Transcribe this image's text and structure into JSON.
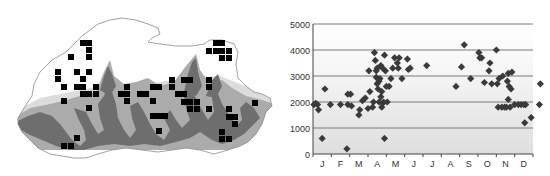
{
  "map": {
    "title": "",
    "marker_color": "#000000",
    "terrain_dark": "#6e6e6e",
    "terrain_mid": "#a8a8a8",
    "terrain_light": "#d9d9d9",
    "outline_color": "#8a8a8a",
    "markers": [
      [
        83,
        43
      ],
      [
        89,
        43
      ],
      [
        89,
        50
      ],
      [
        71,
        57
      ],
      [
        89,
        57
      ],
      [
        58,
        72
      ],
      [
        77,
        72
      ],
      [
        89,
        72
      ],
      [
        58,
        79
      ],
      [
        83,
        79
      ],
      [
        64,
        87
      ],
      [
        77,
        87
      ],
      [
        83,
        87
      ],
      [
        96,
        87
      ],
      [
        83,
        94
      ],
      [
        89,
        94
      ],
      [
        96,
        94
      ],
      [
        64,
        101
      ],
      [
        89,
        108
      ],
      [
        77,
        138
      ],
      [
        64,
        146
      ],
      [
        71,
        146
      ],
      [
        127,
        87
      ],
      [
        121,
        94
      ],
      [
        127,
        94
      ],
      [
        127,
        101
      ],
      [
        140,
        94
      ],
      [
        146,
        94
      ],
      [
        153,
        87
      ],
      [
        159,
        87
      ],
      [
        153,
        101
      ],
      [
        153,
        116
      ],
      [
        159,
        116
      ],
      [
        165,
        116
      ],
      [
        159,
        131
      ],
      [
        172,
        80
      ],
      [
        184,
        80
      ],
      [
        190,
        80
      ],
      [
        172,
        87
      ],
      [
        178,
        94
      ],
      [
        184,
        94
      ],
      [
        184,
        102
      ],
      [
        190,
        102
      ],
      [
        197,
        102
      ],
      [
        190,
        109
      ],
      [
        197,
        109
      ],
      [
        209,
        80
      ],
      [
        209,
        87
      ],
      [
        209,
        109
      ],
      [
        216,
        43
      ],
      [
        222,
        43
      ],
      [
        209,
        51
      ],
      [
        216,
        51
      ],
      [
        222,
        51
      ],
      [
        229,
        51
      ],
      [
        222,
        58
      ],
      [
        229,
        58
      ],
      [
        255,
        103
      ],
      [
        229,
        109
      ],
      [
        229,
        117
      ],
      [
        235,
        117
      ],
      [
        235,
        124
      ],
      [
        222,
        132
      ],
      [
        222,
        139
      ],
      [
        229,
        139
      ]
    ]
  },
  "chart_data": {
    "type": "scatter",
    "title": "",
    "xlabel": "",
    "ylabel": "",
    "ylim": [
      0,
      5000
    ],
    "yticks": [
      0,
      1000,
      2000,
      3000,
      4000,
      5000
    ],
    "ytick_labels": [
      "0",
      "1000",
      "2000",
      "3000",
      "4000",
      "5000"
    ],
    "categories": [
      "J",
      "F",
      "M",
      "A",
      "M",
      "J",
      "J",
      "A",
      "S",
      "O",
      "N",
      "D"
    ],
    "grid": true,
    "legend": "none",
    "marker": "diamond",
    "marker_color": "#3a3a3a",
    "series": [
      {
        "name": "observations",
        "points": [
          [
            0.05,
            1900
          ],
          [
            0.15,
            1950
          ],
          [
            0.3,
            1700
          ],
          [
            0.25,
            1900
          ],
          [
            0.5,
            600
          ],
          [
            0.65,
            2500
          ],
          [
            0.95,
            1900
          ],
          [
            1.5,
            1900
          ],
          [
            1.85,
            200
          ],
          [
            1.9,
            1900
          ],
          [
            1.9,
            2300
          ],
          [
            2.05,
            2300
          ],
          [
            2.1,
            1850
          ],
          [
            2.5,
            1500
          ],
          [
            2.55,
            1700
          ],
          [
            2.7,
            2050
          ],
          [
            2.85,
            2150
          ],
          [
            3.0,
            1750
          ],
          [
            3.1,
            2400
          ],
          [
            3.05,
            3200
          ],
          [
            3.25,
            1800
          ],
          [
            3.3,
            2000
          ],
          [
            3.35,
            3900
          ],
          [
            3.4,
            3600
          ],
          [
            3.45,
            3200
          ],
          [
            3.5,
            3300
          ],
          [
            3.45,
            2950
          ],
          [
            3.5,
            2700
          ],
          [
            3.55,
            2500
          ],
          [
            3.6,
            2800
          ],
          [
            3.6,
            2000
          ],
          [
            3.65,
            2900
          ],
          [
            3.7,
            3400
          ],
          [
            3.7,
            2200
          ],
          [
            3.75,
            1800
          ],
          [
            3.75,
            2400
          ],
          [
            3.8,
            3300
          ],
          [
            3.8,
            1950
          ],
          [
            3.85,
            2000
          ],
          [
            3.9,
            3800
          ],
          [
            3.9,
            600
          ],
          [
            3.95,
            3200
          ],
          [
            4.0,
            2600
          ],
          [
            4.05,
            2000
          ],
          [
            4.15,
            2600
          ],
          [
            4.25,
            2900
          ],
          [
            4.35,
            3300
          ],
          [
            4.45,
            3700
          ],
          [
            4.6,
            3500
          ],
          [
            4.65,
            3300
          ],
          [
            4.7,
            3700
          ],
          [
            4.85,
            2900
          ],
          [
            5.15,
            3650
          ],
          [
            5.2,
            3250
          ],
          [
            5.3,
            3300
          ],
          [
            6.2,
            3400
          ],
          [
            7.8,
            2600
          ],
          [
            8.1,
            3350
          ],
          [
            8.25,
            4200
          ],
          [
            8.6,
            2900
          ],
          [
            9.05,
            3900
          ],
          [
            9.1,
            3700
          ],
          [
            9.2,
            3700
          ],
          [
            9.35,
            2750
          ],
          [
            9.6,
            3200
          ],
          [
            9.65,
            3500
          ],
          [
            9.75,
            2700
          ],
          [
            10.0,
            4000
          ],
          [
            10.05,
            2700
          ],
          [
            10.1,
            1800
          ],
          [
            10.15,
            2900
          ],
          [
            10.3,
            1800
          ],
          [
            10.35,
            3000
          ],
          [
            10.45,
            1800
          ],
          [
            10.55,
            1800
          ],
          [
            10.6,
            2800
          ],
          [
            10.65,
            3100
          ],
          [
            10.65,
            2100
          ],
          [
            10.7,
            2600
          ],
          [
            10.75,
            1800
          ],
          [
            10.8,
            2500
          ],
          [
            10.85,
            3150
          ],
          [
            11.0,
            1900
          ],
          [
            11.2,
            1900
          ],
          [
            11.35,
            1900
          ],
          [
            11.5,
            1900
          ],
          [
            11.55,
            1200
          ],
          [
            11.6,
            1900
          ],
          [
            11.9,
            1400
          ],
          [
            12.35,
            1900
          ],
          [
            12.4,
            2700
          ]
        ]
      }
    ]
  }
}
